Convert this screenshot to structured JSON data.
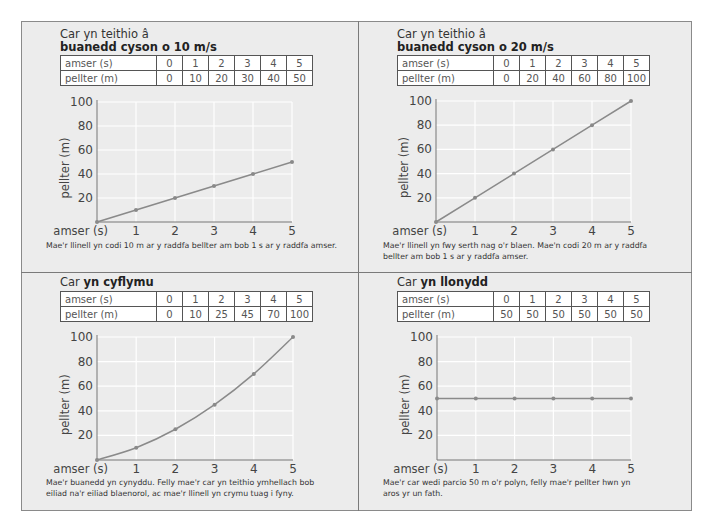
{
  "panels": [
    {
      "title_plain": "Car yn teithio â",
      "title_bold": "buanedd cyson o 10 m/s",
      "table": {
        "row1_label": "amser (s)",
        "row1": [
          "0",
          "1",
          "2",
          "3",
          "4",
          "5"
        ],
        "row2_label": "pellter (m)",
        "row2": [
          "0",
          "10",
          "20",
          "30",
          "40",
          "50"
        ]
      },
      "caption_lines": [
        "Mae'r llinell yn codi 10 m ar y raddfa bellter am bob 1 s ar y raddfa amser."
      ]
    },
    {
      "title_plain": "Car yn teithio â",
      "title_bold": "buanedd cyson o 20 m/s",
      "table": {
        "row1_label": "amser (s)",
        "row1": [
          "0",
          "1",
          "2",
          "3",
          "4",
          "5"
        ],
        "row2_label": "pellter (m)",
        "row2": [
          "0",
          "20",
          "40",
          "60",
          "80",
          "100"
        ]
      },
      "caption_lines": [
        "Mae'r llinell yn fwy serth nag o'r blaen. Mae'n codi 20 m ar y raddfa",
        "bellter am bob 1 s ar y raddfa amser."
      ]
    },
    {
      "title_plain": "Car ",
      "title_bold": "yn cyflymu",
      "table": {
        "row1_label": "amser (s)",
        "row1": [
          "0",
          "1",
          "2",
          "3",
          "4",
          "5"
        ],
        "row2_label": "pellter (m)",
        "row2": [
          "0",
          "10",
          "25",
          "45",
          "70",
          "100"
        ]
      },
      "caption_lines": [
        "Mae'r buanedd yn cynyddu. Felly mae'r car yn teithio ymhellach bob",
        "eiliad na'r eiliad blaenorol, ac mae'r llinell yn crymu tuag i fyny."
      ]
    },
    {
      "title_plain": "Car ",
      "title_bold": "yn llonydd",
      "table": {
        "row1_label": "amser (s)",
        "row1": [
          "0",
          "1",
          "2",
          "3",
          "4",
          "5"
        ],
        "row2_label": "pellter (m)",
        "row2": [
          "50",
          "50",
          "50",
          "50",
          "50",
          "50"
        ]
      },
      "caption_lines": [
        "Mae'r car wedi parcio 50 m o'r polyn, felly mae'r pellter hwn yn",
        "aros yr un fath."
      ]
    }
  ],
  "colors": {
    "line": "#8a8a8a",
    "marker": "#8a8a8a",
    "grid": "#ffffff",
    "axis": "#777777",
    "panel_bg": "#ececec"
  },
  "chart_data": [
    {
      "type": "line",
      "title": "Car yn teithio â buanedd cyson o 10 m/s",
      "xlabel": "amser (s)",
      "ylabel": "pellter (m)",
      "x": [
        0,
        1,
        2,
        3,
        4,
        5
      ],
      "series": [
        {
          "name": "pellter (m)",
          "values": [
            0,
            10,
            20,
            30,
            40,
            50
          ]
        }
      ],
      "xticks": [
        "1",
        "2",
        "3",
        "4",
        "5"
      ],
      "yticks": [
        "20",
        "40",
        "60",
        "80",
        "100"
      ],
      "xlim": [
        0,
        5
      ],
      "ylim": [
        0,
        100
      ],
      "grid": true,
      "legend": "none"
    },
    {
      "type": "line",
      "title": "Car yn teithio â buanedd cyson o 20 m/s",
      "xlabel": "amser (s)",
      "ylabel": "pellter (m)",
      "x": [
        0,
        1,
        2,
        3,
        4,
        5
      ],
      "series": [
        {
          "name": "pellter (m)",
          "values": [
            0,
            20,
            40,
            60,
            80,
            100
          ]
        }
      ],
      "xticks": [
        "1",
        "2",
        "3",
        "4",
        "5"
      ],
      "yticks": [
        "20",
        "40",
        "60",
        "80",
        "100"
      ],
      "xlim": [
        0,
        5
      ],
      "ylim": [
        0,
        100
      ],
      "grid": true,
      "legend": "none"
    },
    {
      "type": "line",
      "title": "Car yn cyflymu",
      "xlabel": "amser (s)",
      "ylabel": "pellter (m)",
      "x": [
        0,
        1,
        2,
        3,
        4,
        5
      ],
      "series": [
        {
          "name": "pellter (m)",
          "values": [
            0,
            10,
            25,
            45,
            70,
            100
          ]
        }
      ],
      "xticks": [
        "1",
        "2",
        "3",
        "4",
        "5"
      ],
      "yticks": [
        "20",
        "40",
        "60",
        "80",
        "100"
      ],
      "xlim": [
        0,
        5
      ],
      "ylim": [
        0,
        100
      ],
      "grid": true,
      "legend": "none",
      "curve": "smooth"
    },
    {
      "type": "line",
      "title": "Car yn llonydd",
      "xlabel": "amser (s)",
      "ylabel": "pellter (m)",
      "x": [
        0,
        1,
        2,
        3,
        4,
        5
      ],
      "series": [
        {
          "name": "pellter (m)",
          "values": [
            50,
            50,
            50,
            50,
            50,
            50
          ]
        }
      ],
      "xticks": [
        "1",
        "2",
        "3",
        "4",
        "5"
      ],
      "yticks": [
        "20",
        "40",
        "60",
        "80",
        "100"
      ],
      "xlim": [
        0,
        5
      ],
      "ylim": [
        0,
        100
      ],
      "grid": true,
      "legend": "none"
    }
  ]
}
